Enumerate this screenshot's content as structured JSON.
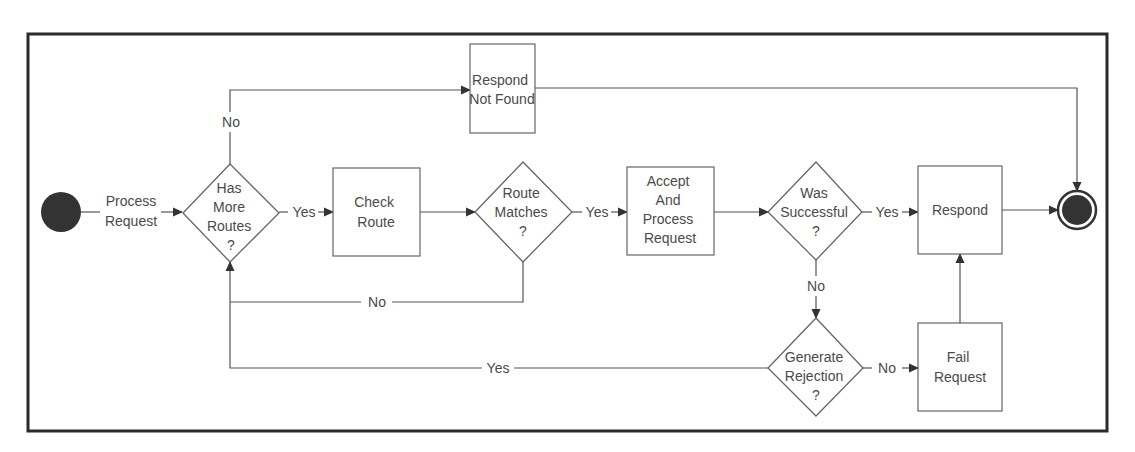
{
  "diagram": {
    "type": "flowchart",
    "colors": {
      "frame": "#2a2a2a",
      "stroke": "#666666",
      "text": "#4a4a4a",
      "terminal_fill": "#333333"
    },
    "nodes": {
      "start": {
        "kind": "start",
        "label": ""
      },
      "has_more_routes": {
        "kind": "decision",
        "lines": [
          "Has",
          "More",
          "Routes",
          "?"
        ]
      },
      "check_route": {
        "kind": "process",
        "lines": [
          "Check",
          "Route"
        ]
      },
      "route_matches": {
        "kind": "decision",
        "lines": [
          "Route",
          "Matches",
          "?"
        ]
      },
      "accept_process": {
        "kind": "process",
        "lines": [
          "Accept",
          "And",
          "Process",
          "Request"
        ]
      },
      "was_successful": {
        "kind": "decision",
        "lines": [
          "Was",
          "Successful",
          "?"
        ]
      },
      "respond": {
        "kind": "process",
        "lines": [
          "Respond"
        ]
      },
      "respond_not_found": {
        "kind": "process",
        "lines": [
          "Respond",
          "Not Found"
        ]
      },
      "generate_rejection": {
        "kind": "decision",
        "lines": [
          "Generate",
          "Rejection",
          "?"
        ]
      },
      "fail_request": {
        "kind": "process",
        "lines": [
          "Fail",
          "Request"
        ]
      },
      "end": {
        "kind": "end",
        "label": ""
      }
    },
    "edges": {
      "start_to_has_more": {
        "lines": [
          "Process",
          "Request"
        ]
      },
      "has_more_yes": "Yes",
      "has_more_no": "No",
      "route_matches_yes": "Yes",
      "route_matches_no": "No",
      "was_successful_yes": "Yes",
      "was_successful_no": "No",
      "generate_rejection_yes": "Yes",
      "generate_rejection_no": "No"
    }
  }
}
